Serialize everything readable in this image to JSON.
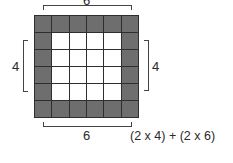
{
  "diagram": {
    "grid": {
      "rows": 6,
      "cols": 6,
      "shaded": "border",
      "shade_color": "#6e6e6e",
      "inner_color": "#ffffff"
    },
    "labels": {
      "top": "6",
      "bottom": "6",
      "left": "4",
      "right": "4",
      "formula": "(2 x 4) + (2 x 6)"
    }
  }
}
